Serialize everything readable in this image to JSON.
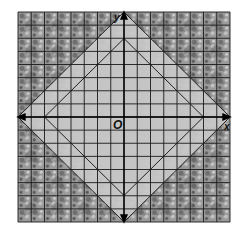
{
  "diagram": {
    "type": "coordinate-grid-with-nested-diamonds",
    "axes": {
      "x_label": "x",
      "y_label": "y",
      "origin_label": "O"
    },
    "grid": {
      "cells_x": 16,
      "cells_y": 16,
      "range": [
        -8,
        8
      ]
    },
    "shapes": [
      {
        "name": "outer-diamond",
        "vertices": [
          [
            0,
            8
          ],
          [
            8,
            0
          ],
          [
            0,
            -8
          ],
          [
            -8,
            0
          ]
        ]
      },
      {
        "name": "inner-diamond",
        "vertices": [
          [
            0,
            6
          ],
          [
            6,
            0
          ],
          [
            0,
            -6
          ],
          [
            -6,
            0
          ]
        ]
      }
    ],
    "colors": {
      "grid_line": "#1a1a1a",
      "axis": "#000000",
      "diamond_fill": "#c8c8c8",
      "background_texture": "#8a8a8a"
    }
  }
}
